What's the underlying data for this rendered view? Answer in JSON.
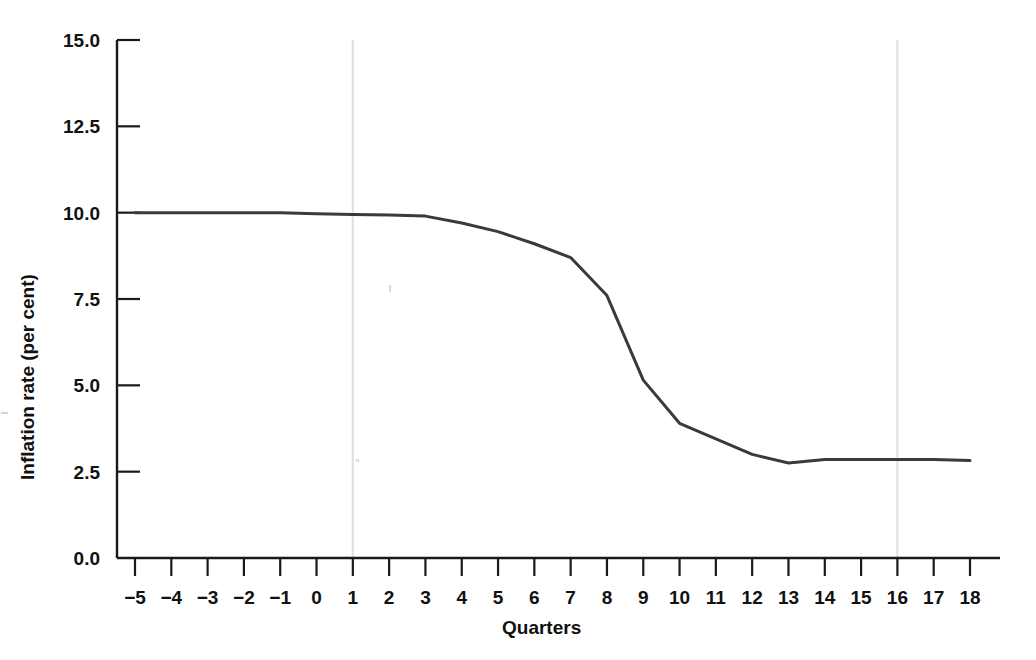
{
  "chart_data": {
    "type": "line",
    "title": "",
    "xlabel": "Quarters",
    "ylabel": "Inflation rate (per cent)",
    "xlim": [
      -5,
      18
    ],
    "ylim": [
      0.0,
      15.0
    ],
    "grid": false,
    "legend": null,
    "x_tick_labels": [
      "−5",
      "−4",
      "−3",
      "−2",
      "−1",
      "0",
      "1",
      "2",
      "3",
      "4",
      "5",
      "6",
      "7",
      "8",
      "9",
      "10",
      "11",
      "12",
      "13",
      "14",
      "15",
      "16",
      "17",
      "18"
    ],
    "x_tick_values": [
      -5,
      -4,
      -3,
      -2,
      -1,
      0,
      1,
      2,
      3,
      4,
      5,
      6,
      7,
      8,
      9,
      10,
      11,
      12,
      13,
      14,
      15,
      16,
      17,
      18
    ],
    "y_tick_labels": [
      "0.0",
      "2.5",
      "5.0",
      "7.5",
      "10.0",
      "12.5",
      "15.0"
    ],
    "y_tick_values": [
      0.0,
      2.5,
      5.0,
      7.5,
      10.0,
      12.5,
      15.0
    ],
    "vertical_reference_lines": [
      1,
      16
    ],
    "line_color": "#3a3a3a",
    "line_width": 3.0,
    "x": [
      -5,
      -4,
      -3,
      -2,
      -1,
      0,
      1,
      2,
      3,
      4,
      5,
      6,
      7,
      8,
      9,
      10,
      11,
      12,
      13,
      14,
      15,
      16,
      17,
      18
    ],
    "values": [
      10.0,
      10.0,
      10.0,
      10.0,
      10.0,
      9.97,
      9.95,
      9.93,
      9.9,
      9.7,
      9.45,
      9.1,
      8.7,
      7.6,
      5.15,
      3.9,
      3.45,
      3.0,
      2.75,
      2.85,
      2.85,
      2.85,
      2.85,
      2.82
    ],
    "series": [
      {
        "name": "Inflation rate",
        "values": [
          10.0,
          10.0,
          10.0,
          10.0,
          10.0,
          9.97,
          9.95,
          9.93,
          9.9,
          9.7,
          9.45,
          9.1,
          8.7,
          7.6,
          5.15,
          3.9,
          3.45,
          3.0,
          2.75,
          2.85,
          2.85,
          2.85,
          2.85,
          2.82
        ]
      }
    ]
  },
  "axes": {
    "spine_color": "#1a1a1a",
    "reference_line_color": "#e2e2e2"
  }
}
